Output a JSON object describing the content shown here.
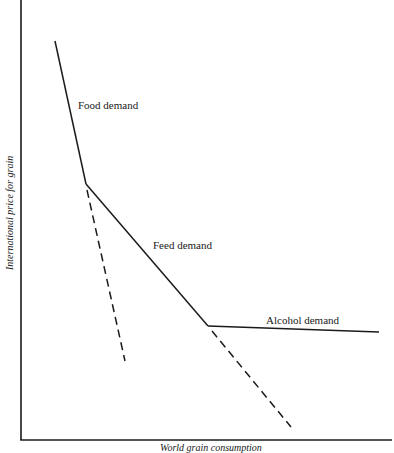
{
  "diagram": {
    "type": "kinked-demand-curve",
    "axes": {
      "y_label": "International price for grain",
      "x_label": "World grain consumption",
      "x_label_visible": "partially cropped at bottom edge",
      "origin": [
        21,
        440
      ],
      "y_top": [
        21,
        0
      ],
      "x_right": [
        392,
        440
      ]
    },
    "segments": [
      {
        "name": "Food demand",
        "style": "solid",
        "points": [
          [
            55,
            41
          ],
          [
            86,
            184
          ]
        ]
      },
      {
        "name": "Feed demand",
        "style": "solid",
        "points": [
          [
            86,
            184
          ],
          [
            208,
            326
          ]
        ]
      },
      {
        "name": "Alcohol demand",
        "style": "solid",
        "points": [
          [
            208,
            326
          ],
          [
            379,
            332
          ]
        ]
      },
      {
        "name": "food-demand-extension",
        "style": "dashed",
        "points": [
          [
            86,
            184
          ],
          [
            125,
            361
          ]
        ]
      },
      {
        "name": "feed-demand-extension",
        "style": "dashed",
        "points": [
          [
            208,
            326
          ],
          [
            291,
            427
          ]
        ]
      }
    ],
    "labels": {
      "food": "Food demand",
      "feed": "Feed demand",
      "alcohol": "Alcohol demand"
    },
    "colors": {
      "line": "#1a1a1a",
      "background": "#ffffff"
    }
  }
}
